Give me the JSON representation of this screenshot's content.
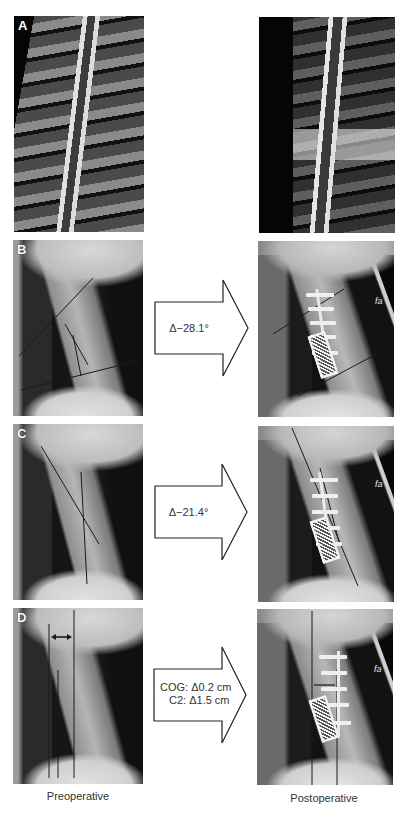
{
  "figure": {
    "rows": [
      {
        "id": "A",
        "label": "A",
        "modality": "MRI T2 sagittal",
        "preop_panel": {
          "letter": "A"
        },
        "postop_panel": {},
        "arrow": null
      },
      {
        "id": "B",
        "label": "B",
        "modality": "Lateral X-ray",
        "preop_panel": {
          "letter": "B",
          "marker": "a"
        },
        "postop_panel": {
          "marker": "fa"
        },
        "arrow": {
          "lines": [
            "Δ−28.1°"
          ]
        }
      },
      {
        "id": "C",
        "label": "C",
        "modality": "Lateral X-ray",
        "preop_panel": {
          "letter": "C",
          "marker": "a"
        },
        "postop_panel": {
          "marker": "fa"
        },
        "arrow": {
          "lines": [
            "Δ−21.4°"
          ]
        }
      },
      {
        "id": "D",
        "label": "D",
        "modality": "Lateral X-ray",
        "preop_panel": {
          "letter": "D",
          "marker": "a"
        },
        "postop_panel": {
          "marker": "fa"
        },
        "arrow": {
          "lines": [
            "COG: Δ0.2 cm",
            "C2: Δ1.5 cm"
          ]
        }
      }
    ],
    "captions": {
      "left": "Preoperative",
      "right": "Postoperative"
    },
    "colors": {
      "background": "#ffffff",
      "arrow_stroke": "#222222",
      "arrow_fill": "#ffffff",
      "text": "#333333",
      "overlay_line": "#1a1a1a"
    }
  }
}
